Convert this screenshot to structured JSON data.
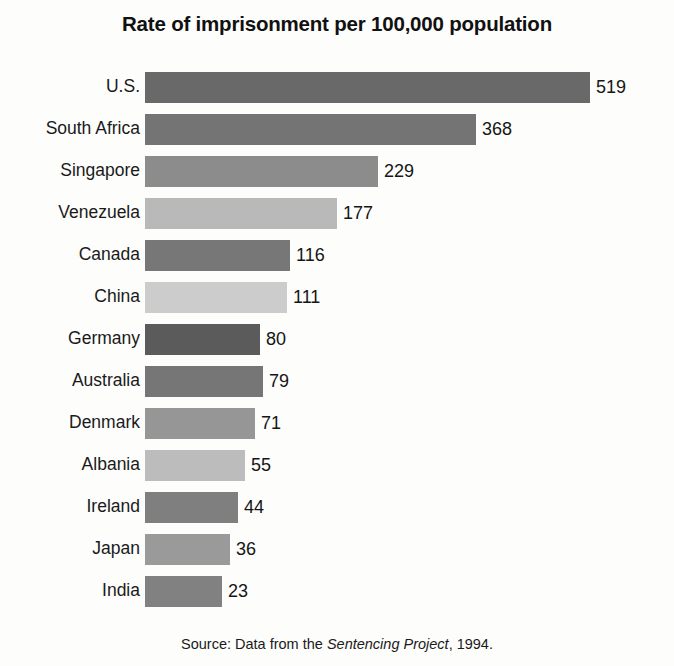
{
  "chart_data": {
    "type": "bar",
    "orientation": "horizontal",
    "title": "Rate of imprisonment per 100,000 population",
    "xlabel": "",
    "ylabel": "",
    "grid": false,
    "legend": null,
    "xlim": [
      0,
      519
    ],
    "categories": [
      "U.S.",
      "South Africa",
      "Singapore",
      "Venezuela",
      "Canada",
      "China",
      "Germany",
      "Australia",
      "Denmark",
      "Albania",
      "Ireland",
      "Japan",
      "India"
    ],
    "values": [
      519,
      368,
      229,
      177,
      116,
      111,
      80,
      79,
      71,
      55,
      44,
      36,
      23
    ],
    "value_labels": [
      "519",
      "368",
      "229",
      "177",
      "116",
      "111",
      "80",
      "79",
      "71",
      "55",
      "44",
      "36",
      "23"
    ],
    "bar_colors": [
      "#696969",
      "#747474",
      "#8c8c8c",
      "#b9b9b9",
      "#777777",
      "#cccccc",
      "#5b5b5b",
      "#767676",
      "#969696",
      "#bcbcbc",
      "#7f7f7f",
      "#9a9a9a",
      "#818181"
    ],
    "bar_pixel_widths": [
      445,
      331,
      233,
      192,
      145,
      142,
      115,
      118,
      110,
      100,
      93,
      85,
      77
    ],
    "bars": [
      {
        "category": "U.S.",
        "value": 519,
        "label": "519",
        "color": "#696969",
        "width_px": 445
      },
      {
        "category": "South Africa",
        "value": 368,
        "label": "368",
        "color": "#747474",
        "width_px": 331
      },
      {
        "category": "Singapore",
        "value": 229,
        "label": "229",
        "color": "#8c8c8c",
        "width_px": 233
      },
      {
        "category": "Venezuela",
        "value": 177,
        "label": "177",
        "color": "#b9b9b9",
        "width_px": 192
      },
      {
        "category": "Canada",
        "value": 116,
        "label": "116",
        "color": "#777777",
        "width_px": 145
      },
      {
        "category": "China",
        "value": 111,
        "label": "111",
        "color": "#cccccc",
        "width_px": 142
      },
      {
        "category": "Germany",
        "value": 80,
        "label": "80",
        "color": "#5b5b5b",
        "width_px": 115
      },
      {
        "category": "Australia",
        "value": 79,
        "label": "79",
        "color": "#767676",
        "width_px": 118
      },
      {
        "category": "Denmark",
        "value": 71,
        "label": "71",
        "color": "#969696",
        "width_px": 110
      },
      {
        "category": "Albania",
        "value": 55,
        "label": "55",
        "color": "#bcbcbc",
        "width_px": 100
      },
      {
        "category": "Ireland",
        "value": 44,
        "label": "44",
        "color": "#7f7f7f",
        "width_px": 93
      },
      {
        "category": "Japan",
        "value": 36,
        "label": "36",
        "color": "#9a9a9a",
        "width_px": 85
      },
      {
        "category": "India",
        "value": 23,
        "label": "23",
        "color": "#818181",
        "width_px": 77
      }
    ]
  },
  "source": {
    "prefix": "Source: Data from the ",
    "italic": "Sentencing Project",
    "suffix": ", 1994."
  }
}
